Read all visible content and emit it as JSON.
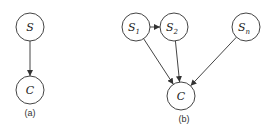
{
  "diagrams": [
    {
      "id": "a",
      "caption": "(a)",
      "nodes": [
        {
          "id": "S",
          "label": "S",
          "sub": "",
          "x": 30,
          "y": 27
        },
        {
          "id": "C",
          "label": "C",
          "sub": "",
          "x": 30,
          "y": 90
        }
      ],
      "edges": [
        [
          "S",
          "C"
        ]
      ]
    },
    {
      "id": "b",
      "caption": "(b)",
      "nodes": [
        {
          "id": "S1",
          "label": "S",
          "sub": "1",
          "x": 136,
          "y": 27
        },
        {
          "id": "S2",
          "label": "S",
          "sub": "2",
          "x": 174,
          "y": 27
        },
        {
          "id": "Sn",
          "label": "S",
          "sub": "n",
          "x": 246,
          "y": 27
        },
        {
          "id": "C",
          "label": "C",
          "sub": "",
          "x": 181,
          "y": 96
        }
      ],
      "edges": [
        [
          "S1",
          "S2"
        ],
        [
          "S1",
          "C"
        ],
        [
          "S2",
          "C"
        ],
        [
          "Sn",
          "C"
        ]
      ]
    }
  ],
  "captions": {
    "a": "(a)",
    "b": "(b)"
  },
  "node_radius": 14
}
